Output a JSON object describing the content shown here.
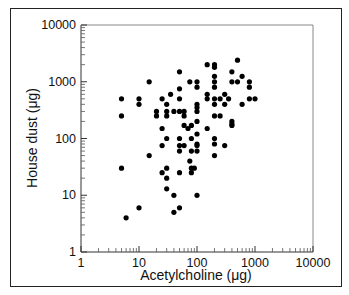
{
  "chart_data": {
    "type": "scatter",
    "title": "",
    "xlabel": "Acetylcholine (μg)",
    "ylabel": "House dust (μg)",
    "xscale": "log",
    "yscale": "log",
    "xlim": [
      1,
      10000
    ],
    "ylim": [
      1,
      10000
    ],
    "xticks": [
      "1",
      "10",
      "100",
      "1000",
      "10000"
    ],
    "yticks": [
      "1",
      "10",
      "100",
      "1000",
      "10000"
    ],
    "grid": false,
    "legend": null,
    "marker_color": "#000000",
    "points": [
      [
        5,
        500
      ],
      [
        5,
        250
      ],
      [
        5,
        30
      ],
      [
        6,
        4
      ],
      [
        10,
        500
      ],
      [
        10,
        400
      ],
      [
        10,
        6
      ],
      [
        15,
        1000
      ],
      [
        15,
        50
      ],
      [
        20,
        300
      ],
      [
        20,
        250
      ],
      [
        25,
        500
      ],
      [
        25,
        150
      ],
      [
        25,
        75
      ],
      [
        25,
        25
      ],
      [
        30,
        400
      ],
      [
        30,
        300
      ],
      [
        30,
        250
      ],
      [
        30,
        100
      ],
      [
        30,
        30
      ],
      [
        30,
        20
      ],
      [
        30,
        13
      ],
      [
        35,
        600
      ],
      [
        40,
        300
      ],
      [
        40,
        10
      ],
      [
        40,
        5
      ],
      [
        50,
        1500
      ],
      [
        50,
        750
      ],
      [
        50,
        500
      ],
      [
        50,
        300
      ],
      [
        50,
        100
      ],
      [
        50,
        75
      ],
      [
        50,
        60
      ],
      [
        50,
        25
      ],
      [
        50,
        6
      ],
      [
        60,
        300
      ],
      [
        60,
        250
      ],
      [
        60,
        170
      ],
      [
        60,
        75
      ],
      [
        70,
        150
      ],
      [
        75,
        1000
      ],
      [
        75,
        40
      ],
      [
        80,
        170
      ],
      [
        80,
        100
      ],
      [
        80,
        60
      ],
      [
        80,
        30
      ],
      [
        80,
        25
      ],
      [
        90,
        30
      ],
      [
        100,
        1000
      ],
      [
        100,
        800
      ],
      [
        100,
        400
      ],
      [
        100,
        350
      ],
      [
        100,
        300
      ],
      [
        100,
        200
      ],
      [
        100,
        120
      ],
      [
        100,
        80
      ],
      [
        100,
        75
      ],
      [
        100,
        60
      ],
      [
        100,
        10
      ],
      [
        150,
        2000
      ],
      [
        150,
        600
      ],
      [
        150,
        500
      ],
      [
        150,
        150
      ],
      [
        200,
        2000
      ],
      [
        200,
        1800
      ],
      [
        200,
        1250
      ],
      [
        200,
        1000
      ],
      [
        200,
        800
      ],
      [
        200,
        500
      ],
      [
        200,
        400
      ],
      [
        200,
        250
      ],
      [
        200,
        100
      ],
      [
        200,
        80
      ],
      [
        200,
        50
      ],
      [
        250,
        500
      ],
      [
        250,
        250
      ],
      [
        300,
        600
      ],
      [
        300,
        400
      ],
      [
        300,
        75
      ],
      [
        350,
        500
      ],
      [
        400,
        1500
      ],
      [
        400,
        1000
      ],
      [
        400,
        200
      ],
      [
        400,
        180
      ],
      [
        400,
        170
      ],
      [
        500,
        2400
      ],
      [
        500,
        1000
      ],
      [
        600,
        1250
      ],
      [
        600,
        400
      ],
      [
        800,
        1000
      ],
      [
        800,
        800
      ],
      [
        800,
        500
      ],
      [
        1000,
        500
      ]
    ]
  }
}
